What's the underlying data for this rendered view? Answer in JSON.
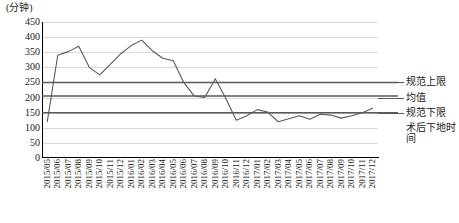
{
  "chart_data": {
    "type": "line",
    "title": "",
    "subtitle": "",
    "xlabel": "",
    "ylabel": "(分钟)",
    "y_unit_caption": "(分钟)",
    "ylim": [
      0,
      450
    ],
    "ytick_step": 50,
    "yticks": [
      450,
      400,
      350,
      300,
      250,
      200,
      150,
      100,
      50,
      0
    ],
    "ytick_labels": [
      "450",
      "400",
      "350",
      "300",
      "250",
      "200",
      "150",
      "100",
      "50",
      "0"
    ],
    "grid": true,
    "grid_axis": "y",
    "legend_position": "right",
    "categories": [
      "2015/05",
      "2015/06",
      "2015/07",
      "2015/08",
      "2015/09",
      "2015/10",
      "2015/11",
      "2015/12",
      "2016/01",
      "2016/02",
      "2016/03",
      "2016/04",
      "2016/05",
      "2016/06",
      "2016/07",
      "2016/08",
      "2016/09",
      "2016/10",
      "2016/11",
      "2016/12",
      "2017/01",
      "2017/02",
      "2017/03",
      "2017/04",
      "2017/05",
      "2017/06",
      "2017/07",
      "2017/08",
      "2017/09",
      "2017/10",
      "2017/11",
      "2017/12"
    ],
    "series": [
      {
        "name": "术后下地时间",
        "type": "line",
        "color": "#595959",
        "values": [
          120,
          340,
          352,
          370,
          300,
          275,
          310,
          345,
          372,
          390,
          355,
          330,
          322,
          250,
          205,
          200,
          262,
          198,
          125,
          140,
          160,
          152,
          120,
          130,
          140,
          128,
          145,
          142,
          132,
          140,
          150,
          165
        ]
      }
    ],
    "reference_lines": [
      {
        "name": "规范上限",
        "value": 250,
        "color": "#595959"
      },
      {
        "name": "均值",
        "value": 205,
        "color": "#595959"
      },
      {
        "name": "规范下限",
        "value": 150,
        "color": "#595959"
      }
    ],
    "legend": [
      {
        "label": "规范上限",
        "color": "#595959"
      },
      {
        "label": "均值",
        "color": "#595959"
      },
      {
        "label": "规范下限",
        "color": "#595959"
      },
      {
        "label": "术后下地时间",
        "color": "#595959"
      }
    ]
  },
  "colors": {
    "series_line": "#595959",
    "reference_line": "#595959",
    "gridline": "#d9d9d9",
    "axis": "#000000",
    "text": "#1a1a1a",
    "background": "#ffffff"
  }
}
